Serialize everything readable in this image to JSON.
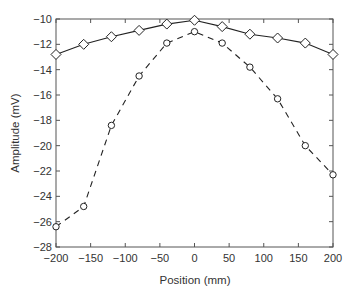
{
  "chart_data": {
    "type": "line",
    "title": "",
    "xlabel": "Position (mm)",
    "ylabel": "Amplitude (mV)",
    "xlim": [
      -200,
      200
    ],
    "ylim": [
      -28,
      -10
    ],
    "xticks": [
      -200,
      -150,
      -100,
      -50,
      0,
      50,
      100,
      150,
      200
    ],
    "yticks": [
      -10,
      -12,
      -14,
      -16,
      -18,
      -20,
      -22,
      -24,
      -26,
      -28
    ],
    "grid": false,
    "legend": null,
    "x": [
      -200,
      -160,
      -120,
      -80,
      -40,
      0,
      40,
      80,
      120,
      160,
      200
    ],
    "series": [
      {
        "name": "diamond-solid",
        "marker": "diamond",
        "line": "solid",
        "values": [
          -12.8,
          -12.0,
          -11.4,
          -10.9,
          -10.4,
          -10.1,
          -10.6,
          -11.2,
          -11.5,
          -11.9,
          -12.8
        ]
      },
      {
        "name": "circle-dashed",
        "marker": "circle",
        "line": "dashed",
        "values": [
          -26.4,
          -24.8,
          -18.4,
          -14.5,
          -11.9,
          -11.0,
          -11.9,
          -13.8,
          -16.3,
          -20.0,
          -22.3
        ]
      }
    ]
  },
  "colors": {
    "line": "#222222",
    "axis": "#555555",
    "marker_fill": "#ffffff"
  }
}
